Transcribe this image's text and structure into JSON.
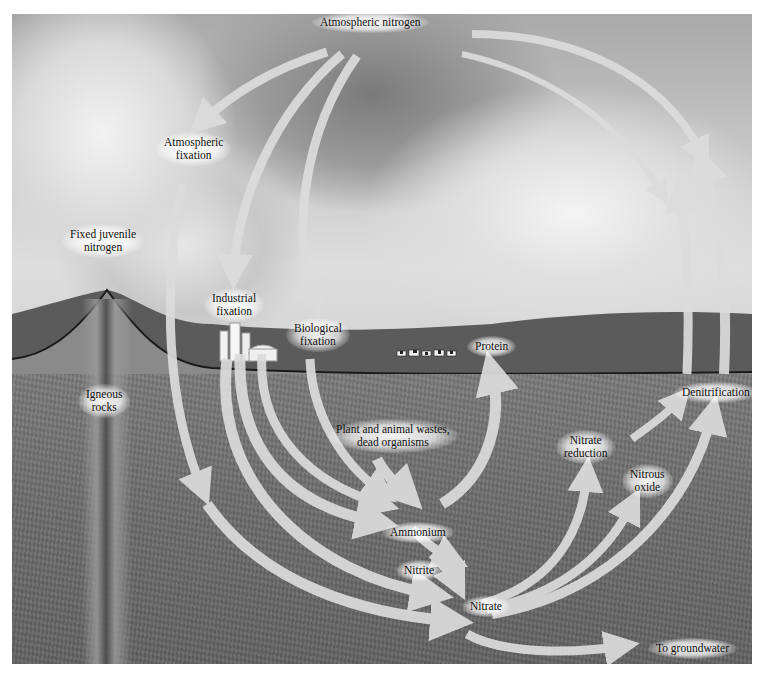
{
  "diagram": {
    "nodes": {
      "atmospheric_nitrogen": "Atmospheric nitrogen",
      "atmospheric_fixation": [
        "Atmospheric",
        "fixation"
      ],
      "fixed_juvenile_nitrogen": [
        "Fixed juvenile",
        "nitrogen"
      ],
      "industrial_fixation": [
        "Industrial",
        "fixation"
      ],
      "biological_fixation": [
        "Biological",
        "fixation"
      ],
      "protein": "Protein",
      "igneous_rocks": [
        "Igneous",
        "rocks"
      ],
      "plant_animal_wastes": [
        "Plant and animal wastes,",
        "dead organisms"
      ],
      "ammonium": "Ammonium",
      "nitrite": "Nitrite",
      "nitrate": "Nitrate",
      "nitrate_reduction": [
        "Nitrate",
        "reduction"
      ],
      "nitrous_oxide": [
        "Nitrous",
        "oxide"
      ],
      "denitrification": "Denitrification",
      "to_groundwater": "To groundwater"
    },
    "edges": [
      {
        "from": "Atmospheric nitrogen",
        "to": "Atmospheric fixation"
      },
      {
        "from": "Atmospheric nitrogen",
        "to": "Industrial fixation"
      },
      {
        "from": "Atmospheric nitrogen",
        "to": "Biological fixation"
      },
      {
        "from": "Atmospheric fixation",
        "to": "Nitrate"
      },
      {
        "from": "Industrial fixation",
        "to": "Ammonium"
      },
      {
        "from": "Industrial fixation",
        "to": "Nitrate"
      },
      {
        "from": "Biological fixation",
        "to": "Ammonium"
      },
      {
        "from": "Plant and animal wastes, dead organisms",
        "to": "Ammonium"
      },
      {
        "from": "Ammonium",
        "to": "Protein"
      },
      {
        "from": "Ammonium",
        "to": "Nitrite"
      },
      {
        "from": "Nitrite",
        "to": "Nitrate"
      },
      {
        "from": "Nitrate",
        "to": "Nitrate reduction"
      },
      {
        "from": "Nitrate",
        "to": "Nitrous oxide"
      },
      {
        "from": "Nitrate",
        "to": "Denitrification"
      },
      {
        "from": "Nitrate",
        "to": "To groundwater"
      },
      {
        "from": "Nitrous oxide",
        "to": "Denitrification"
      },
      {
        "from": "Denitrification",
        "to": "Atmospheric nitrogen"
      }
    ],
    "colors": {
      "arrow_fill": "#d9d9d9",
      "arrow_stroke": "#bdbdbd",
      "label_text": "#111111",
      "soil": "#6e6e6e",
      "sky": "#c4c4c4"
    }
  }
}
